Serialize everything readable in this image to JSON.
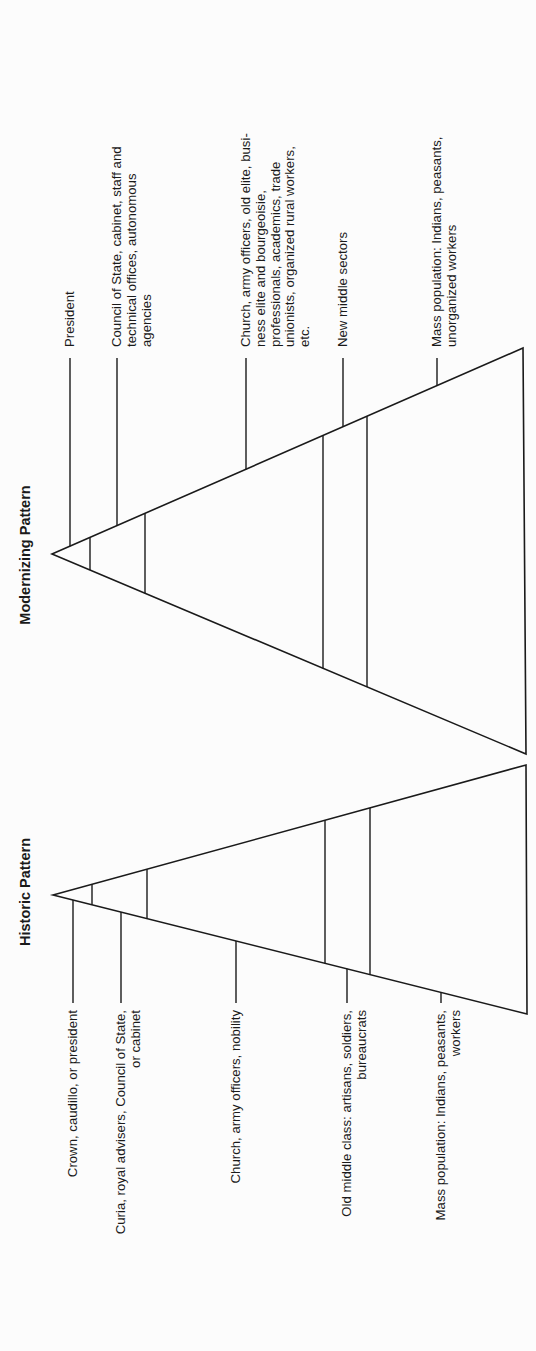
{
  "figure": {
    "colors": {
      "ink": "#1a1a1a",
      "paper": "#fcfcfc"
    },
    "orientation": "rotated-90-ccw",
    "patterns": [
      {
        "id": "modernizing",
        "title": "Modernizing Pattern",
        "title_pos": {
          "x": 25,
          "y": 555
        },
        "triangle": {
          "apex": [
            52,
            554
          ],
          "top": [
            523,
            348
          ],
          "bottom": [
            526,
            754
          ]
        },
        "strata_x": [
          90,
          145,
          323,
          367
        ],
        "label_side": "top",
        "label_anchor": "start",
        "label_base_y": 347,
        "leader_end_y": 358,
        "labels": [
          {
            "x": 70,
            "lines": [
              "President"
            ]
          },
          {
            "x": 117,
            "lines": [
              "Council of State, cabinet, staff and",
              "technical offices, autonomous",
              "agencies"
            ]
          },
          {
            "x": 246,
            "lines": [
              "Church, army officers, old elite, busi-",
              "ness elite and bourgeoisie,",
              "professionals, academics, trade",
              "unionists, organized rural workers,",
              "etc."
            ]
          },
          {
            "x": 343,
            "lines": [
              "New middle sectors"
            ]
          },
          {
            "x": 437,
            "lines": [
              "Mass population: Indians, peasants,",
              "unorganized workers"
            ]
          }
        ]
      },
      {
        "id": "historic",
        "title": "Historic Pattern",
        "title_pos": {
          "x": 25,
          "y": 892
        },
        "triangle": {
          "apex": [
            53,
            895
          ],
          "top": [
            526,
            765
          ],
          "bottom": [
            527,
            1014
          ]
        },
        "strata_x": [
          92,
          147,
          325,
          370
        ],
        "label_side": "bottom",
        "label_anchor": "end",
        "label_base_y": 1010,
        "leader_end_y": 1003,
        "labels": [
          {
            "x": 73,
            "lines": [
              "Crown, caudillo, or president"
            ]
          },
          {
            "x": 121,
            "lines": [
              "Curia, royal advisers, Council of State,",
              "or cabinet"
            ]
          },
          {
            "x": 236,
            "lines": [
              "Church, army officers, nobility"
            ]
          },
          {
            "x": 347,
            "lines": [
              "Old middle class: artisans, soldiers,",
              "bureaucrats"
            ]
          },
          {
            "x": 441,
            "lines": [
              "Mass population: Indians, peasants,",
              "workers"
            ]
          }
        ]
      }
    ]
  }
}
